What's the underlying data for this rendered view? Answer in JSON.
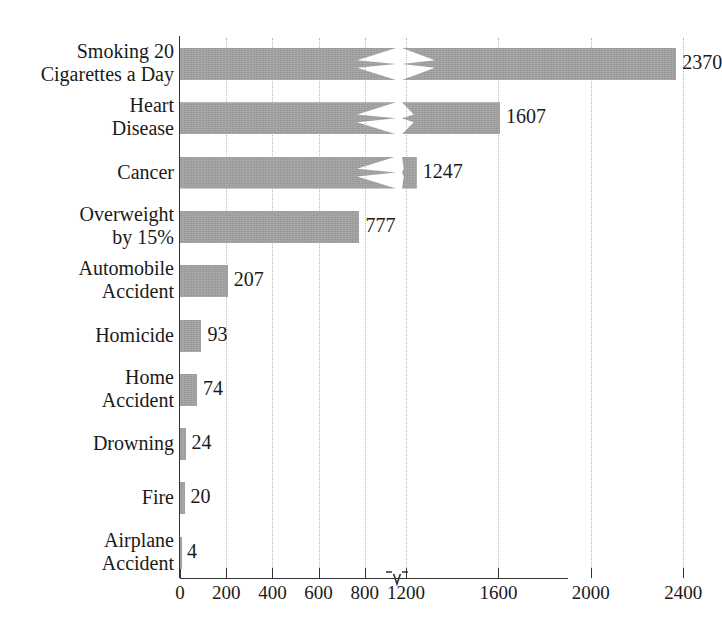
{
  "chart_data": {
    "type": "bar",
    "orientation": "horizontal",
    "title": "Due to Various Hazards",
    "xlabel": "",
    "ylabel": "",
    "grid": true,
    "legend": null,
    "axis_break": {
      "after": 800,
      "resumes_at": 1200,
      "position_value": 1000
    },
    "xticks": [
      0,
      200,
      400,
      600,
      800,
      1200,
      1600,
      2000,
      2400
    ],
    "xtick_labels": [
      "0",
      "200",
      "400",
      "600",
      "800",
      "1200",
      "1600",
      "2000",
      "2400"
    ],
    "xlim": [
      0,
      2400
    ],
    "categories": [
      "Smoking 20 Cigarettes a Day",
      "Heart Disease",
      "Cancer",
      "Overweight by 15%",
      "Automobile Accident",
      "Homicide",
      "Home Accident",
      "Drowning",
      "Fire",
      "Airplane Accident"
    ],
    "values": [
      2370,
      1607,
      1247,
      777,
      207,
      93,
      74,
      24,
      20,
      4
    ],
    "bar_color": "#9a9a9a",
    "data_labels": [
      "2370",
      "1607",
      "1247",
      "777",
      "207",
      "93",
      "74",
      "24",
      "20",
      "4"
    ]
  },
  "categories_display": [
    {
      "line1": "Smoking 20",
      "line2": "Cigarettes a Day"
    },
    {
      "line1": "Heart",
      "line2": "Disease"
    },
    {
      "line1": "Cancer",
      "line2": ""
    },
    {
      "line1": "Overweight",
      "line2": "by 15%"
    },
    {
      "line1": "Automobile",
      "line2": "Accident"
    },
    {
      "line1": "Homicide",
      "line2": ""
    },
    {
      "line1": "Home",
      "line2": "Accident"
    },
    {
      "line1": "Drowning",
      "line2": ""
    },
    {
      "line1": "Fire",
      "line2": ""
    },
    {
      "line1": "Airplane",
      "line2": "Accident"
    }
  ]
}
